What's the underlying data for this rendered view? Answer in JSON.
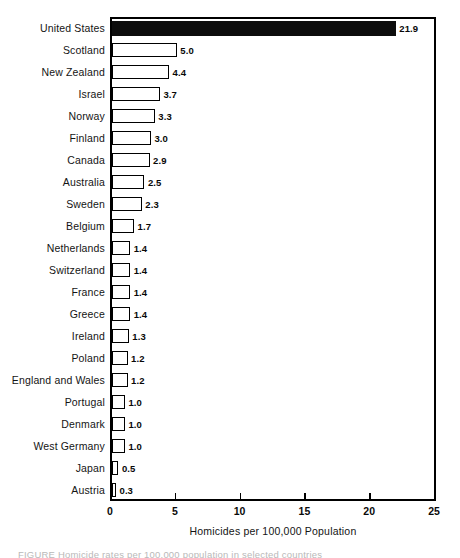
{
  "chart_data": {
    "type": "bar",
    "orientation": "horizontal",
    "title": "",
    "xlabel": "Homicides per 100,000 Population",
    "ylabel": "",
    "xlim": [
      0,
      25
    ],
    "xticks": [
      0,
      5,
      10,
      15,
      20,
      25
    ],
    "xtick_labels": [
      "0",
      "5",
      "10",
      "15",
      "20",
      "25"
    ],
    "grid": false,
    "legend": null,
    "categories": [
      "United States",
      "Scotland",
      "New Zealand",
      "Israel",
      "Norway",
      "Finland",
      "Canada",
      "Australia",
      "Sweden",
      "Belgium",
      "Netherlands",
      "Switzerland",
      "France",
      "Greece",
      "Ireland",
      "Poland",
      "England and Wales",
      "Portugal",
      "Denmark",
      "West Germany",
      "Japan",
      "Austria"
    ],
    "values": [
      21.9,
      5.0,
      4.4,
      3.7,
      3.3,
      3.0,
      2.9,
      2.5,
      2.3,
      1.7,
      1.4,
      1.4,
      1.4,
      1.4,
      1.3,
      1.2,
      1.2,
      1.0,
      1.0,
      1.0,
      0.5,
      0.3
    ],
    "value_labels": [
      "21.9",
      "5.0",
      "4.4",
      "3.7",
      "3.3",
      "3.0",
      "2.9",
      "2.5",
      "2.3",
      "1.7",
      "1.4",
      "1.4",
      "1.4",
      "1.4",
      "1.3",
      "1.2",
      "1.2",
      "1.0",
      "1.0",
      "1.0",
      "0.5",
      "0.3"
    ],
    "highlighted_category": "United States",
    "colors": {
      "bar_fill": "#ffffff",
      "bar_edge": "#000000",
      "highlight_fill": "#0d0d0d",
      "axis": "#000000",
      "text": "#141414",
      "background": "#ffffff"
    }
  },
  "caption_sliver": "FIGURE  Homicide rates per 100,000 population in selected countries"
}
